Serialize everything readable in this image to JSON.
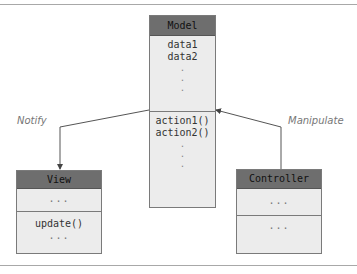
{
  "diagram": {
    "model": {
      "name": "Model",
      "attributes": [
        "data1",
        "data2",
        ".",
        ".",
        "."
      ],
      "methods": [
        "action1()",
        "action2()",
        ".",
        ".",
        "."
      ]
    },
    "view": {
      "name": "View",
      "attributes": [
        "..."
      ],
      "methods": [
        "update()",
        "..."
      ]
    },
    "controller": {
      "name": "Controller",
      "attributes": [
        "..."
      ],
      "methods": [
        "..."
      ]
    },
    "edges": [
      {
        "from": "Model",
        "to": "View",
        "label": "Notify"
      },
      {
        "from": "Controller",
        "to": "Model",
        "label": "Manipulate"
      }
    ]
  },
  "colors": {
    "header": "#6e6e6e",
    "body": "#ececec",
    "border": "#7a7a7a",
    "edge_label": "#777777"
  }
}
